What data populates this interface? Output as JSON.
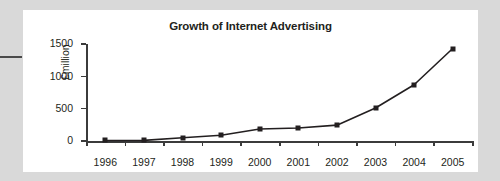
{
  "figure": {
    "title": "Growth of Internet Advertising",
    "gutter_rule": "page-margin-rule"
  },
  "colors": {
    "page_background": "#d9d9d9",
    "card_background": "#ffffff",
    "ink": "#231f20",
    "axis": "#3b3b3b",
    "series_line": "#231f20",
    "marker_fill": "#231f20"
  },
  "chart_data": {
    "type": "line",
    "title": "Growth of Internet Advertising",
    "xlabel": "",
    "ylabel": "£million",
    "categories": [
      "1996",
      "1997",
      "1998",
      "1999",
      "2000",
      "2001",
      "2002",
      "2003",
      "2004",
      "2005"
    ],
    "x": [
      1996,
      1997,
      1998,
      1999,
      2000,
      2001,
      2002,
      2003,
      2004,
      2005
    ],
    "values": [
      8,
      10,
      50,
      90,
      185,
      200,
      245,
      510,
      870,
      1430
    ],
    "series": [
      {
        "name": "Internet advertising spend",
        "values": [
          8,
          10,
          50,
          90,
          185,
          200,
          245,
          510,
          870,
          1430
        ]
      }
    ],
    "ylim": [
      0,
      1500
    ],
    "yticks": [
      0,
      500,
      1000,
      1500
    ],
    "ytick_labels": [
      "0",
      "500",
      "1000",
      "1500"
    ],
    "xtick_labels": [
      "1996",
      "1997",
      "1998",
      "1999",
      "2000",
      "2001",
      "2002",
      "2003",
      "2004",
      "2005"
    ],
    "grid": false,
    "legend": false,
    "marker": "square",
    "units": "£million"
  }
}
